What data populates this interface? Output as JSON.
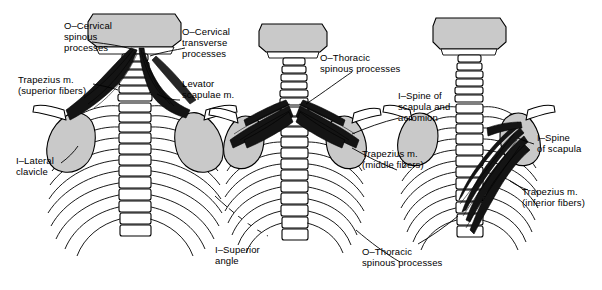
{
  "figure": {
    "views": [
      {
        "name": "superior-fibers-view",
        "caption": "Trapezius m. (superior fibers)"
      },
      {
        "name": "middle-fibers-view",
        "caption": "Trapezius m. (middle fibers)"
      },
      {
        "name": "inferior-fibers-view",
        "caption": "Trapezius m. (inferior fibers)"
      }
    ],
    "colors": {
      "outline": "#000000",
      "bone_fill": "#ffffff",
      "bone_shade": "#c9c9c9",
      "muscle": "#141414",
      "background": "#ffffff"
    }
  },
  "labels": [
    {
      "id": "l1",
      "text": "O–Cervical\nspinous\nprocesses",
      "align": "left"
    },
    {
      "id": "l2",
      "text": "O–Cervical\ntransverse\nprocesses",
      "align": "left"
    },
    {
      "id": "l3",
      "text": "Trapezius m.\n(superior fibers)",
      "align": "left"
    },
    {
      "id": "l4",
      "text": "Levator\nscapulae m.",
      "align": "left"
    },
    {
      "id": "l5",
      "text": "I–Lateral\nclavicle",
      "align": "left"
    },
    {
      "id": "l6",
      "text": "I–Superior\nangle",
      "align": "left"
    },
    {
      "id": "l7",
      "text": "O–Thoracic\nspinous processes",
      "align": "left"
    },
    {
      "id": "l8",
      "text": "I–Spine of\nscapula and\nacromion",
      "align": "left"
    },
    {
      "id": "l9",
      "text": "Trapezius m.\n(middle fibers)",
      "align": "left"
    },
    {
      "id": "l10",
      "text": "O–Thoracic\nspinous processes",
      "align": "left"
    },
    {
      "id": "l11",
      "text": "I–Spine\nof scapula",
      "align": "left"
    },
    {
      "id": "l12",
      "text": "Trapezius m.\n(inferior fibers)",
      "align": "left"
    }
  ]
}
